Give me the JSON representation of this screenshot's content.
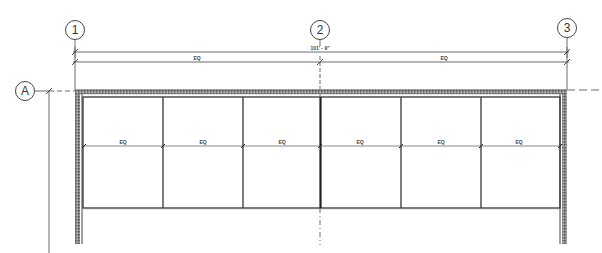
{
  "drawing": {
    "type": "architectural-plan-elevation",
    "grid_lines": {
      "vertical": [
        {
          "label": "1",
          "x": 75
        },
        {
          "label": "2",
          "x": 320
        },
        {
          "label": "3",
          "x": 567
        }
      ],
      "horizontal": [
        {
          "label": "A",
          "y": 91
        }
      ]
    },
    "dimensions": {
      "overall": {
        "text": "101' - 9\"",
        "from": "1",
        "to": "3"
      },
      "bay_1_2": {
        "text": "EQ"
      },
      "bay_2_3": {
        "text": "EQ"
      },
      "panels": [
        "EQ",
        "EQ",
        "EQ",
        "EQ",
        "EQ",
        "EQ"
      ]
    },
    "panel_count": 6,
    "colors": {
      "line": "#333333",
      "wall_hatch": "#555555",
      "background": "#ffffff"
    }
  }
}
